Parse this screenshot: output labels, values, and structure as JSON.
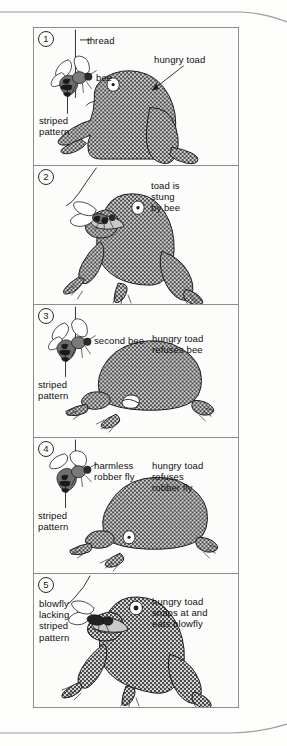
{
  "figure": {
    "panel_count": 5,
    "frame_color": "#8d8d8d",
    "ink_color": "#1d1d1d",
    "toad_fill": "halftone-gray",
    "panels": [
      {
        "number": "1",
        "number_glyph": "1",
        "labels": {
          "thread": "thread",
          "bee": "bee",
          "striped_pattern": "striped\npattern",
          "hungry_toad": "hungry toad"
        },
        "insect": "bee",
        "toad_pose": "sitting-upright"
      },
      {
        "number": "2",
        "number_glyph": "2",
        "labels": {
          "caption": "toad is\nstung\nby bee"
        },
        "insect": "bee",
        "toad_pose": "crouched-stung"
      },
      {
        "number": "3",
        "number_glyph": "3",
        "labels": {
          "second_bee": "second bee",
          "striped_pattern": "striped\npattern",
          "caption": "hungry toad\nrefuses bee"
        },
        "insect": "bee",
        "toad_pose": "hunkered-down"
      },
      {
        "number": "4",
        "number_glyph": "4",
        "labels": {
          "insect_label": "harmless\nrobber fly",
          "striped_pattern": "striped\npattern",
          "caption": "hungry toad\nrefuses\nrobber fly"
        },
        "insect": "robber fly",
        "toad_pose": "hunkered-down"
      },
      {
        "number": "5",
        "number_glyph": "5",
        "labels": {
          "insect_label": "blowfly\nlacking\nstriped\npattern",
          "caption": "hungry toad\nsnaps at and\neats blowfly"
        },
        "insect": "blowfly",
        "toad_pose": "lunging-snapping"
      }
    ]
  }
}
